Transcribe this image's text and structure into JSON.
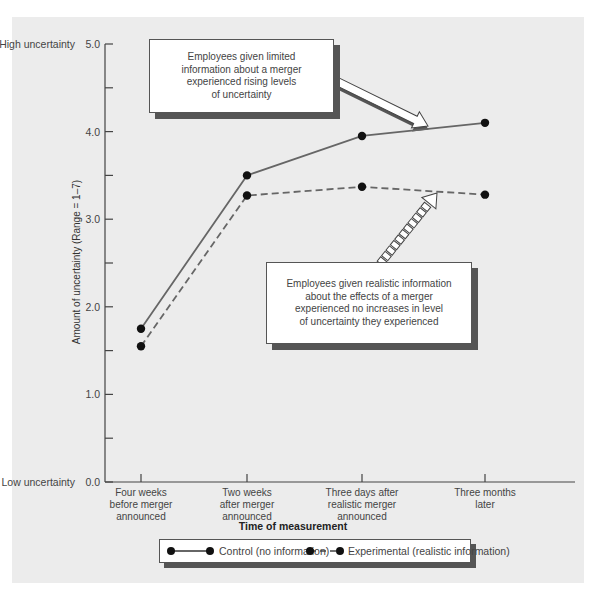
{
  "chart_data": {
    "type": "line",
    "title": "",
    "xlabel": "Time of measurement",
    "ylabel": "Amount of uncertainty (Range = 1–7)",
    "ylim": [
      0,
      5
    ],
    "y_ticks": [
      "0.0",
      "1.0",
      "2.0",
      "3.0",
      "4.0",
      "5.0"
    ],
    "y_end_labels": {
      "top": "High uncertainty",
      "bottom": "Low uncertainty"
    },
    "categories": [
      [
        "Four weeks",
        "before merger",
        "announced"
      ],
      [
        "Two weeks",
        "after merger",
        "announced"
      ],
      [
        "Three days after",
        "realistic merger",
        "announced"
      ],
      [
        "Three months",
        "later"
      ]
    ],
    "series": [
      {
        "name": "Control (no information)",
        "style": "solid",
        "values": [
          1.75,
          3.5,
          3.95,
          4.1
        ]
      },
      {
        "name": "Experimental (realistic information)",
        "style": "dashed",
        "values": [
          1.55,
          3.27,
          3.37,
          3.28
        ]
      }
    ],
    "annotations": [
      {
        "id": "control-callout",
        "lines": [
          "Employees given limited",
          "information about a merger",
          "experienced rising levels",
          "of uncertainty"
        ]
      },
      {
        "id": "experimental-callout",
        "lines": [
          "Employees given realistic information",
          "about the effects of a merger",
          "experienced no increases in level",
          "of uncertainty they experienced"
        ]
      }
    ],
    "legend_position": "bottom",
    "grid": false
  },
  "colors": {
    "panel": "#ececec",
    "line": "#666666",
    "marker": "#111111",
    "shadow": "#555555"
  }
}
